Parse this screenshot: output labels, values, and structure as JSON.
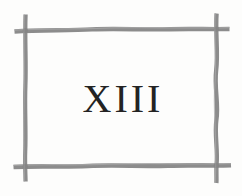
{
  "page": {
    "background_color": "#fdfdfc",
    "chapter_number": "XIII",
    "chapter_number_color": "#232323"
  },
  "frame": {
    "name": "hand-drawn-twig-border",
    "stroke_color": "#8a8a8a",
    "stroke_color_light": "#9a9a9a",
    "stroke_color_dark": "#7d7d7d",
    "sides": [
      {
        "name": "top-rail",
        "label": "top"
      },
      {
        "name": "bottom-rail",
        "label": "bottom"
      },
      {
        "name": "left-rail",
        "label": "left"
      },
      {
        "name": "right-rail",
        "label": "right"
      }
    ],
    "corners": [
      {
        "name": "corner-top-left"
      },
      {
        "name": "corner-top-right"
      },
      {
        "name": "corner-bottom-left"
      },
      {
        "name": "corner-bottom-right"
      }
    ]
  }
}
